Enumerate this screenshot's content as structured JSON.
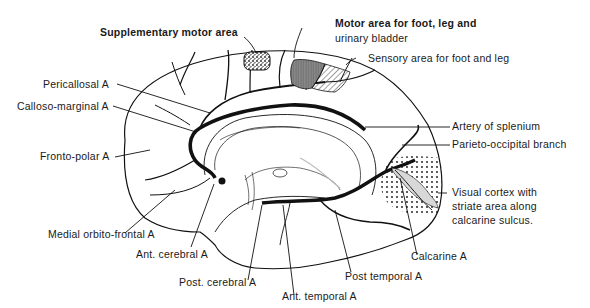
{
  "diagram": {
    "labels": {
      "supplementary_motor": "Supplementary motor area",
      "motor_line1": "Motor area for foot, leg and",
      "motor_line2": "urinary bladder",
      "sensory": "Sensory area for foot and leg",
      "pericallosal": "Pericallosal A",
      "calloso_marginal": "Calloso-marginal A",
      "fronto_polar": "Fronto-polar A",
      "artery_splenium": "Artery of splenium",
      "parieto_occipital": "Parieto-occipital branch",
      "visual_line1": "Visual cortex with",
      "visual_line2": "striate area along",
      "visual_line3": "calcarine sulcus.",
      "medial_orbito": "Medial orbito-frontal A",
      "ant_cerebral": "Ant. cerebral A",
      "post_cerebral": "Post. cerebral A",
      "ant_temporal": "Ant. temporal A",
      "post_temporal": "Post temporal A",
      "calcarine": "Calcarine A"
    },
    "colors": {
      "ink": "#111111",
      "motor_fill": "#8a8a8a",
      "striate_fill": "#d8d8d8"
    }
  }
}
